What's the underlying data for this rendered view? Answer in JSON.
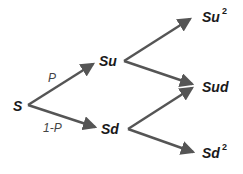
{
  "diagram": {
    "type": "binomial-tree",
    "steps": 2,
    "colors": {
      "arrow": "#555555",
      "node_text": "#1a1a1a",
      "edge_text": "#444444",
      "background": "#ffffff"
    },
    "nodes": {
      "root": {
        "base": "S",
        "exp": ""
      },
      "up": {
        "base": "Su",
        "exp": ""
      },
      "down": {
        "base": "Sd",
        "exp": ""
      },
      "upup": {
        "base": "Su",
        "exp": "2"
      },
      "updown": {
        "base": "Sud",
        "exp": ""
      },
      "downdown": {
        "base": "Sd",
        "exp": "2"
      }
    },
    "edge_labels": {
      "up_prob": "P",
      "down_prob": "1-P"
    },
    "edges": [
      {
        "from": "S",
        "to": "Su",
        "label": "P"
      },
      {
        "from": "S",
        "to": "Sd",
        "label": "1-P"
      },
      {
        "from": "Su",
        "to": "Su²",
        "label": ""
      },
      {
        "from": "Su",
        "to": "Sud",
        "label": ""
      },
      {
        "from": "Sd",
        "to": "Sud",
        "label": ""
      },
      {
        "from": "Sd",
        "to": "Sd²",
        "label": ""
      }
    ]
  }
}
